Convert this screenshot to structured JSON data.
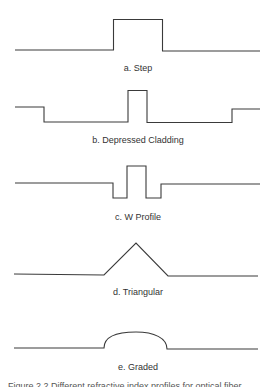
{
  "figure": {
    "stroke_color": "#3a3a3a",
    "profiles": [
      {
        "id": "step",
        "label": "a. Step",
        "points": "15,50 113.5,50 113.5,19.5 162.5,19.5 162.5,51 260,51"
      },
      {
        "id": "depressed-cladding",
        "label": "b. Depressed Cladding",
        "points": "15,107 44,107 44,122 128,122 128,90.5 147,90.5 147,122.5 232,122.5 232,109 260,109"
      },
      {
        "id": "w-profile",
        "label": "c. W Profile",
        "points": "15,183 113,183 113,198 127,198 127,166 146,166 146,198 161,198 161,184 260,184"
      },
      {
        "id": "triangular",
        "label": "d. Triangular",
        "points": "14,274 104,275 136,243 168,276 258,276"
      },
      {
        "id": "graded",
        "label": "e. Graded",
        "path": "M14,348 L104,348 C104,336 118,332 136,332 C154,332 167,338 167,349 L258,349"
      }
    ],
    "caption_clipped": "Figure 2.2   Different refractive index profiles for optical fiber"
  }
}
